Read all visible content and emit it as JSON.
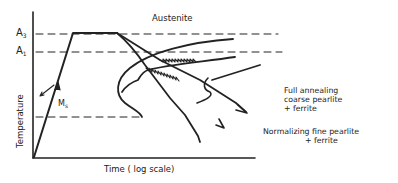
{
  "diagram": {
    "type": "heat-treatment time-temperature diagram",
    "region_label": "Austenite",
    "critical_temps": [
      {
        "symbol": "A",
        "sub": "3"
      },
      {
        "symbol": "A",
        "sub": "1"
      }
    ],
    "ms_label": {
      "symbol": "M",
      "sub": "s"
    },
    "x_axis_label": "Time ( log scale)",
    "y_axis_label": "Temperature",
    "annotations": [
      {
        "lines": [
          "Full annealing",
          "coarse pearlite",
          "+  ferrite"
        ]
      },
      {
        "lines": [
          "Normalizing fine pearlite",
          "+  ferrite"
        ]
      }
    ],
    "colors": {
      "ink": "#222222",
      "background": "#ffffff"
    }
  }
}
